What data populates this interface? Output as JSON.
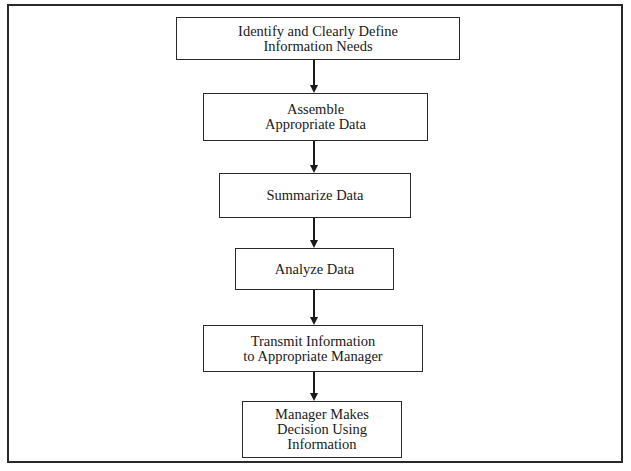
{
  "diagram": {
    "type": "flowchart",
    "direction": "top-to-bottom",
    "colors": {
      "stroke": "#2a2a2a",
      "fill": "#ffffff",
      "text": "#1a1a1a"
    },
    "nodes": [
      {
        "id": "n1",
        "label": "Identify and Clearly Define\nInformation Needs"
      },
      {
        "id": "n2",
        "label": "Assemble\nAppropriate Data"
      },
      {
        "id": "n3",
        "label": "Summarize Data"
      },
      {
        "id": "n4",
        "label": "Analyze Data"
      },
      {
        "id": "n5",
        "label": "Transmit Information\nto Appropriate Manager"
      },
      {
        "id": "n6",
        "label": "Manager Makes\nDecision Using\nInformation"
      }
    ],
    "edges": [
      {
        "from": "n1",
        "to": "n2"
      },
      {
        "from": "n2",
        "to": "n3"
      },
      {
        "from": "n3",
        "to": "n4"
      },
      {
        "from": "n4",
        "to": "n5"
      },
      {
        "from": "n5",
        "to": "n6"
      }
    ]
  }
}
